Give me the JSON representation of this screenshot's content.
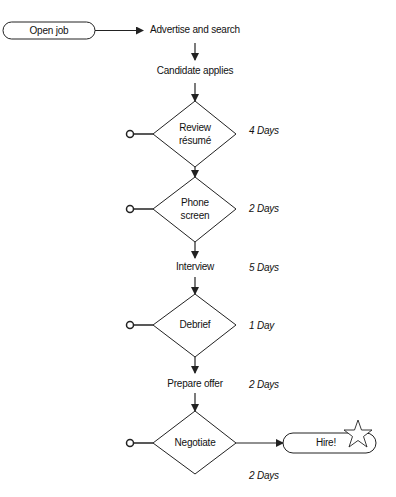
{
  "diagram": {
    "type": "hiring-process-flowchart",
    "colors": {
      "stroke": "#222222",
      "text": "#111111",
      "background": "#ffffff"
    },
    "start": {
      "label": "Open job",
      "shape": "rounded-pill"
    },
    "steps": [
      {
        "id": "advertise",
        "label": "Advertise and search",
        "shape": "text"
      },
      {
        "id": "applies",
        "label": "Candidate applies",
        "shape": "text"
      },
      {
        "id": "review",
        "label_line1": "Review",
        "label_line2": "résumé",
        "shape": "diamond",
        "duration": "4 Days",
        "exit": "circle-terminal"
      },
      {
        "id": "phone",
        "label_line1": "Phone",
        "label_line2": "screen",
        "shape": "diamond",
        "duration": "2 Days",
        "exit": "circle-terminal"
      },
      {
        "id": "interview",
        "label": "Interview",
        "shape": "text",
        "duration": "5 Days"
      },
      {
        "id": "debrief",
        "label": "Debrief",
        "shape": "diamond",
        "duration": "1 Day",
        "exit": "circle-terminal"
      },
      {
        "id": "offer",
        "label": "Prepare offer",
        "shape": "text",
        "duration": "2 Days"
      },
      {
        "id": "negotiate",
        "label": "Negotiate",
        "shape": "diamond",
        "duration": "2 Days",
        "exit": "circle-terminal"
      }
    ],
    "end": {
      "label": "Hire!",
      "shape": "rounded-pill",
      "icon": "star-icon"
    }
  }
}
